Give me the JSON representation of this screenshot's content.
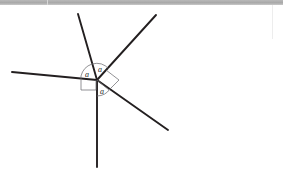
{
  "figure": {
    "background_color": "#ffffff",
    "line_color": "#231f20",
    "marker_color": "#6f6f73",
    "top_bar_color": "#b9b9b9",
    "vertex": {
      "x": 97,
      "y": 80,
      "name": "common-vertex"
    },
    "rays": [
      {
        "name": "ray-left",
        "x1": 97,
        "y1": 80,
        "x2": 12,
        "y2": 72
      },
      {
        "name": "ray-upper-left",
        "x1": 97,
        "y1": 80,
        "x2": 78,
        "y2": 14
      },
      {
        "name": "ray-upper-right",
        "x1": 97,
        "y1": 80,
        "x2": 156,
        "y2": 15
      },
      {
        "name": "ray-lower-right",
        "x1": 97,
        "y1": 80,
        "x2": 168,
        "y2": 130
      },
      {
        "name": "ray-bottom",
        "x1": 97,
        "y1": 80,
        "x2": 97,
        "y2": 167
      }
    ],
    "angle_labels": [
      {
        "name": "angle-label-left",
        "text": "a",
        "x": 88,
        "y": 75
      },
      {
        "name": "angle-label-top",
        "text": "a",
        "x": 101,
        "y": 70
      },
      {
        "name": "angle-label-lower",
        "text": "a",
        "x": 103,
        "y": 92
      }
    ],
    "angle_arcs": [
      {
        "name": "angle-arc-left",
        "d": "M 81 76 A 17 17 0 0 1 92 64"
      },
      {
        "name": "angle-arc-top",
        "d": "M 92 64 A 17 17 0 0 1 109 69"
      },
      {
        "name": "angle-arc-lower",
        "d": "M 110 89 A 16 16 0 0 1 97 96"
      }
    ],
    "right_angle_markers": [
      {
        "name": "right-angle-marker-lower-left",
        "points": "81,76 81,90 96,90 96,80"
      },
      {
        "name": "right-angle-marker-right",
        "points": "106,70 119,80 109,90 97,80"
      }
    ]
  }
}
